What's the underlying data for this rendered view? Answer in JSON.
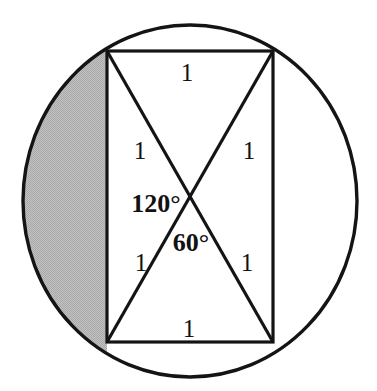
{
  "figure": {
    "background_color": "#ffffff",
    "stroke_color": "#141414",
    "shade_color": "#b7b7b7",
    "shade_label": "shaded circular segment",
    "canvas": {
      "width": 377,
      "height": 391
    }
  },
  "circle": {
    "name": "circumscribed-circle",
    "center_x": 190,
    "center_y": 201,
    "radius_x": 167,
    "radius_y": 176,
    "stroke_width": 3.4
  },
  "rectangle": {
    "name": "inscribed-rectangle",
    "left": 107,
    "top": 51,
    "right": 273,
    "bottom": 342,
    "stroke_width": 3.2
  },
  "diagonals": [
    {
      "name": "diagonal-top-left-to-bottom-right",
      "x1": 107,
      "y1": 51,
      "x2": 273,
      "y2": 342
    },
    {
      "name": "diagonal-top-right-to-bottom-left",
      "x1": 273,
      "y1": 51,
      "x2": 107,
      "y2": 342
    }
  ],
  "intersection": {
    "name": "diagonal-intersection",
    "x": 190,
    "y": 196
  },
  "labels": {
    "top_side": {
      "text": "1",
      "x": 187,
      "y": 72
    },
    "bottom_side": {
      "text": "1",
      "x": 189,
      "y": 328
    },
    "upper_left_half_diagonal": {
      "text": "1",
      "x": 140,
      "y": 150
    },
    "upper_right_half_diagonal": {
      "text": "1",
      "x": 249,
      "y": 150
    },
    "lower_left_half_diagonal": {
      "text": "1",
      "x": 141,
      "y": 262
    },
    "lower_right_half_diagonal": {
      "text": "1",
      "x": 247,
      "y": 262
    },
    "angle_obtuse": {
      "text": "120°",
      "x": 156,
      "y": 204
    },
    "angle_acute": {
      "text": "60°",
      "x": 191,
      "y": 243
    }
  }
}
